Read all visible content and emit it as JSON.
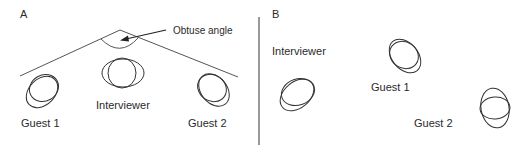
{
  "figure": {
    "panels": [
      {
        "id": "A",
        "letter": "A",
        "annotation": "Obtuse angle",
        "labels": {
          "guest1": "Guest 1",
          "interviewer": "Interviewer",
          "guest2": "Guest 2"
        }
      },
      {
        "id": "B",
        "letter": "B",
        "labels": {
          "interviewer": "Interviewer",
          "guest1": "Guest 1",
          "guest2": "Guest 2"
        }
      }
    ],
    "colors": {
      "stroke": "#333333",
      "angle_line": "#555555",
      "divider": "#555555",
      "text": "#2a2a2a",
      "background": "#ffffff"
    }
  }
}
